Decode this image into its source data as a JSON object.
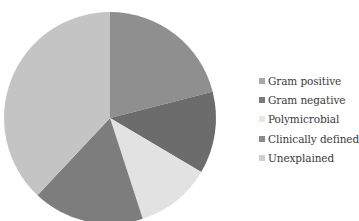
{
  "chart_data": {
    "type": "pie",
    "title": "",
    "labels": [
      "Gram positive",
      "Gram negative",
      "Polymicrobial",
      "Clinically defined",
      "Unexplained"
    ],
    "values": [
      21,
      12.5,
      11.5,
      17,
      38
    ],
    "unit": "percent (estimated from slice angles)",
    "start_angle_deg": 0,
    "direction": "clockwise",
    "colors": [
      "#8f8f8f",
      "#6c6c6c",
      "#e2e2e2",
      "#7d7d7d",
      "#c4c4c4"
    ],
    "legend": {
      "position": "right",
      "entries": [
        "Gram positive",
        "Gram negative",
        "Polymicrobial",
        "Clinically defined",
        "Unexplained"
      ]
    }
  },
  "legend_swatch_colors": [
    "#a9a9a9",
    "#7a7a7a",
    "#e6e6e6",
    "#8a8a8a",
    "#cfcfcf"
  ]
}
